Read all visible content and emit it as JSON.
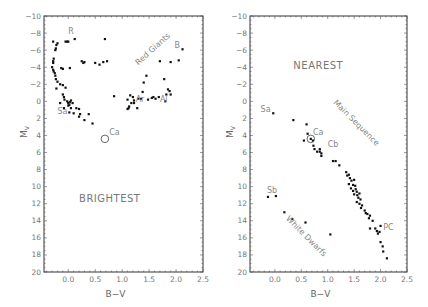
{
  "chart_data": [
    {
      "type": "scatter",
      "title": "BRIGHTEST",
      "xlabel": "B−V",
      "ylabel": "M_V",
      "xlim": [
        -0.45,
        2.5
      ],
      "ylim": [
        20,
        -10
      ],
      "xticks": [
        "0.0",
        "0.5",
        "1.0",
        "1.5",
        "2.0",
        "2.5"
      ],
      "yticks": [
        "-10",
        "-8",
        "-6",
        "-4",
        "-2",
        "0",
        "2",
        "4",
        "6",
        "8",
        "10",
        "12",
        "14",
        "16",
        "18",
        "20"
      ],
      "grid": false,
      "frame": {
        "left": 44,
        "right": 203,
        "top": 16,
        "bottom": 272
      },
      "annotations": [
        {
          "text": "R",
          "x": 0.0,
          "y": -7.9
        },
        {
          "text": "B",
          "x": 1.97,
          "y": -6.3
        },
        {
          "text": "Red Giants",
          "x": 1.3,
          "y": -4.2,
          "rotate": -42
        },
        {
          "text": "Sa",
          "x": -0.2,
          "y": 1.5
        },
        {
          "text": "Ar",
          "x": 1.25,
          "y": 0.1
        },
        {
          "text": "Al",
          "x": 1.7,
          "y": 0.1
        },
        {
          "text": "Ca",
          "x": 0.76,
          "y": 4.0
        }
      ],
      "circled": [
        {
          "x": 0.68,
          "y": 4.4
        }
      ],
      "points": [
        [
          -0.28,
          -7.0
        ],
        [
          -0.2,
          -6.8
        ],
        [
          -0.22,
          -6.6
        ],
        [
          -0.23,
          -6.2
        ],
        [
          -0.24,
          -6.0
        ],
        [
          -0.05,
          -7.0
        ],
        [
          -0.02,
          -7.0
        ],
        [
          0.0,
          -7.0
        ],
        [
          0.12,
          -7.3
        ],
        [
          0.68,
          -7.3
        ],
        [
          -0.27,
          -5.0
        ],
        [
          -0.28,
          -4.7
        ],
        [
          -0.28,
          -4.5
        ],
        [
          -0.3,
          -4.0
        ],
        [
          -0.28,
          -3.7
        ],
        [
          -0.27,
          -3.5
        ],
        [
          -0.25,
          -3.3
        ],
        [
          -0.24,
          -3.0
        ],
        [
          -0.23,
          -2.6
        ],
        [
          -0.2,
          -2.3
        ],
        [
          -0.15,
          -2.0
        ],
        [
          -0.22,
          -1.5
        ],
        [
          -0.1,
          -1.9
        ],
        [
          -0.13,
          -3.9
        ],
        [
          -0.1,
          -3.8
        ],
        [
          0.03,
          -3.9
        ],
        [
          0.25,
          -4.7
        ],
        [
          0.28,
          -4.5
        ],
        [
          0.3,
          -4.6
        ],
        [
          0.5,
          -4.5
        ],
        [
          0.58,
          -4.3
        ],
        [
          0.65,
          -4.6
        ],
        [
          0.72,
          -4.7
        ],
        [
          -0.05,
          -1.6
        ],
        [
          -0.1,
          -0.8
        ],
        [
          -0.08,
          -0.5
        ],
        [
          -0.07,
          -0.2
        ],
        [
          -0.02,
          0.0
        ],
        [
          0.0,
          0.2
        ],
        [
          0.02,
          0.4
        ],
        [
          0.03,
          0.1
        ],
        [
          0.05,
          -0.1
        ],
        [
          0.08,
          0.2
        ],
        [
          -0.15,
          0.2
        ],
        [
          -0.08,
          0.8
        ],
        [
          0.0,
          0.5
        ],
        [
          0.05,
          0.8
        ],
        [
          0.15,
          0.8
        ],
        [
          0.2,
          0.9
        ],
        [
          0.02,
          1.3
        ],
        [
          0.1,
          1.4
        ],
        [
          0.2,
          1.8
        ],
        [
          0.22,
          1.5
        ],
        [
          0.38,
          1.5
        ],
        [
          0.3,
          2.2
        ],
        [
          0.45,
          2.6
        ],
        [
          0.85,
          -0.6
        ],
        [
          1.1,
          -0.2
        ],
        [
          1.15,
          -0.7
        ],
        [
          1.2,
          -0.5
        ],
        [
          1.22,
          -0.1
        ],
        [
          1.1,
          0.9
        ],
        [
          1.12,
          0.8
        ],
        [
          1.13,
          0.6
        ],
        [
          1.17,
          0.2
        ],
        [
          1.22,
          0.2
        ],
        [
          1.3,
          -0.3
        ],
        [
          1.28,
          0.8
        ],
        [
          1.35,
          -0.3
        ],
        [
          1.38,
          -1.1
        ],
        [
          1.4,
          -2.2
        ],
        [
          1.45,
          -3.0
        ],
        [
          1.48,
          -0.2
        ],
        [
          1.55,
          -0.4
        ],
        [
          1.58,
          -0.5
        ],
        [
          1.62,
          -0.3
        ],
        [
          1.68,
          -0.5
        ],
        [
          1.7,
          -4.7
        ],
        [
          1.78,
          -2.6
        ],
        [
          1.8,
          0.0
        ],
        [
          1.82,
          -0.8
        ],
        [
          1.85,
          -1.4
        ],
        [
          1.88,
          -1.2
        ],
        [
          1.9,
          -0.8
        ],
        [
          1.9,
          -4.6
        ],
        [
          2.05,
          -4.8
        ],
        [
          2.12,
          -6.1
        ]
      ]
    },
    {
      "type": "scatter",
      "title": "NEAREST",
      "xlabel": "B−V",
      "ylabel": "M_V",
      "xlim": [
        -0.47,
        2.5
      ],
      "ylim": [
        20,
        -10
      ],
      "xticks": [
        "0.0",
        "0.5",
        "1.0",
        "1.5",
        "2.0",
        "2.5"
      ],
      "yticks": [
        "-10",
        "-8",
        "-6",
        "-4",
        "-2",
        "0",
        "2",
        "4",
        "6",
        "8",
        "10",
        "12",
        "14",
        "16",
        "18",
        "20"
      ],
      "grid": false,
      "frame": {
        "left": 250,
        "right": 407,
        "top": 16,
        "bottom": 272
      },
      "annotations": [
        {
          "text": "Sa",
          "x": -0.27,
          "y": 1.3
        },
        {
          "text": "Main Sequence",
          "x": 1.1,
          "y": 0.2,
          "rotate": 45
        },
        {
          "text": "Ca",
          "x": 0.72,
          "y": 3.9
        },
        {
          "text": "Cb",
          "x": 1.0,
          "y": 5.4
        },
        {
          "text": "Sb",
          "x": -0.15,
          "y": 10.7
        },
        {
          "text": "White Dwarfs",
          "x": 0.2,
          "y": 13.8,
          "rotate": 45
        },
        {
          "text": "PC",
          "x": 2.05,
          "y": 15.1
        }
      ],
      "circled": [
        {
          "x": 0.68,
          "y": 4.4
        }
      ],
      "points": [
        [
          -0.03,
          1.4
        ],
        [
          0.35,
          2.2
        ],
        [
          0.6,
          2.7
        ],
        [
          0.68,
          4.4
        ],
        [
          0.62,
          3.8
        ],
        [
          0.55,
          4.6
        ],
        [
          0.72,
          4.6
        ],
        [
          0.73,
          5.2
        ],
        [
          0.75,
          5.6
        ],
        [
          0.8,
          5.9
        ],
        [
          0.85,
          5.9
        ],
        [
          0.85,
          5.6
        ],
        [
          0.88,
          6.1
        ],
        [
          0.88,
          6.4
        ],
        [
          1.1,
          7.0
        ],
        [
          1.15,
          7.0
        ],
        [
          1.22,
          7.5
        ],
        [
          1.35,
          8.3
        ],
        [
          1.37,
          8.7
        ],
        [
          1.4,
          8.6
        ],
        [
          1.42,
          9.0
        ],
        [
          1.45,
          9.3
        ],
        [
          1.4,
          9.7
        ],
        [
          1.5,
          9.2
        ],
        [
          1.48,
          9.8
        ],
        [
          1.52,
          9.9
        ],
        [
          1.44,
          10.2
        ],
        [
          1.48,
          10.5
        ],
        [
          1.53,
          10.3
        ],
        [
          1.55,
          10.6
        ],
        [
          1.5,
          10.9
        ],
        [
          1.56,
          11.0
        ],
        [
          1.6,
          10.8
        ],
        [
          1.58,
          11.3
        ],
        [
          1.62,
          11.5
        ],
        [
          1.55,
          11.8
        ],
        [
          1.6,
          12.0
        ],
        [
          1.65,
          12.2
        ],
        [
          1.63,
          12.5
        ],
        [
          1.7,
          12.8
        ],
        [
          1.72,
          13.1
        ],
        [
          1.75,
          13.2
        ],
        [
          1.8,
          13.4
        ],
        [
          1.78,
          13.7
        ],
        [
          1.85,
          14.0
        ],
        [
          1.8,
          14.9
        ],
        [
          1.9,
          14.9
        ],
        [
          1.93,
          15.2
        ],
        [
          1.95,
          15.5
        ],
        [
          1.98,
          15.3
        ],
        [
          2.0,
          14.6
        ],
        [
          2.0,
          16.5
        ],
        [
          2.04,
          17.0
        ],
        [
          2.05,
          17.6
        ],
        [
          2.12,
          18.4
        ],
        [
          -0.13,
          11.2
        ],
        [
          0.02,
          11.1
        ],
        [
          0.18,
          13.0
        ],
        [
          0.33,
          13.8
        ],
        [
          0.58,
          14.2
        ],
        [
          1.05,
          15.6
        ]
      ]
    }
  ],
  "labels": {
    "xlabel": "B−V",
    "ylabel_main": "M",
    "ylabel_sub": "V"
  },
  "colors": {
    "points": "#111111",
    "text": "#777777",
    "frame": "#333333"
  }
}
